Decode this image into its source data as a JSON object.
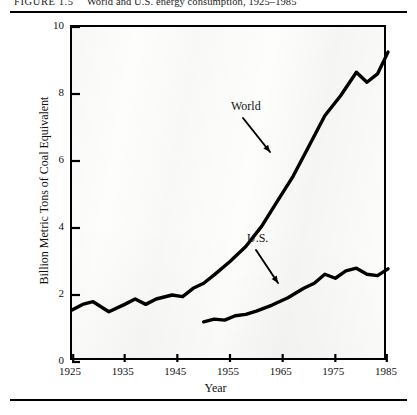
{
  "figure": {
    "label": "FIGURE",
    "number": "1.5",
    "caption": "World and U.S. energy consumption, 1925–1985"
  },
  "chart_data": {
    "type": "line",
    "title": "World and U.S. energy consumption, 1925–1985",
    "xlabel": "Year",
    "ylabel": "Billion Metric Tons of Coal Equivalent",
    "xlim": [
      1925,
      1985
    ],
    "ylim": [
      0,
      10
    ],
    "xticks": [
      1925,
      1935,
      1945,
      1955,
      1965,
      1975,
      1985
    ],
    "yticks": [
      0,
      2,
      4,
      6,
      8,
      10
    ],
    "grid": false,
    "legend_position": "inline-annotations",
    "annotations": [
      {
        "text": "World",
        "series": "World",
        "x": 1962,
        "y": 6.9
      },
      {
        "text": "U.S.",
        "series": "U.S.",
        "x": 1965,
        "y": 3.1
      }
    ],
    "series": [
      {
        "name": "World",
        "color": "#000000",
        "x": [
          1925,
          1927,
          1929,
          1932,
          1935,
          1937,
          1939,
          1941,
          1944,
          1946,
          1948,
          1950,
          1952,
          1955,
          1958,
          1961,
          1964,
          1967,
          1970,
          1973,
          1976,
          1979,
          1981,
          1983,
          1985
        ],
        "y": [
          1.55,
          1.72,
          1.8,
          1.5,
          1.72,
          1.88,
          1.72,
          1.88,
          2.0,
          1.95,
          2.2,
          2.35,
          2.6,
          3.0,
          3.45,
          4.05,
          4.8,
          5.55,
          6.45,
          7.35,
          7.95,
          8.65,
          8.35,
          8.6,
          9.25
        ]
      },
      {
        "name": "U.S.",
        "color": "#000000",
        "x": [
          1950,
          1952,
          1954,
          1956,
          1958,
          1960,
          1963,
          1966,
          1969,
          1971,
          1973,
          1975,
          1977,
          1979,
          1981,
          1983,
          1985
        ],
        "y": [
          1.2,
          1.28,
          1.25,
          1.38,
          1.42,
          1.52,
          1.7,
          1.92,
          2.2,
          2.35,
          2.62,
          2.5,
          2.72,
          2.8,
          2.62,
          2.58,
          2.78
        ]
      }
    ]
  }
}
